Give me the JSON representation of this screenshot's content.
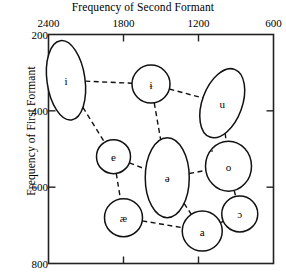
{
  "chart_data": {
    "type": "scatter",
    "title": "",
    "xlabel": "Frequency of Second Formant",
    "ylabel": "Frequency of First Formant",
    "xticks": [
      2400,
      1800,
      1200,
      600
    ],
    "yticks": [
      200,
      400,
      600,
      800
    ],
    "xlim": [
      2400,
      600
    ],
    "ylim": [
      200,
      800
    ],
    "x_axis_position": "top",
    "y_axis_direction": "inverted",
    "grid": false,
    "legend": null,
    "note": "Vowel formant chart: each labelled ellipse marks the dispersion region of one vowel; dashed lines connect neighbouring vowels.",
    "points": [
      {
        "label": "i",
        "f2": 2260,
        "f1": 320,
        "shape": "ellipse",
        "rx": 19,
        "ry": 40,
        "rotate": -8
      },
      {
        "label": "ɨ",
        "f2": 1580,
        "f1": 330,
        "shape": "circle",
        "rx": 19,
        "ry": 19,
        "rotate": 0
      },
      {
        "label": "u",
        "f2": 1010,
        "f1": 380,
        "shape": "ellipse",
        "rx": 20,
        "ry": 36,
        "rotate": 20
      },
      {
        "label": "e",
        "f2": 1880,
        "f1": 520,
        "shape": "circle",
        "rx": 17,
        "ry": 17,
        "rotate": 0
      },
      {
        "label": "ə",
        "f2": 1450,
        "f1": 575,
        "shape": "ellipse",
        "rx": 22,
        "ry": 40,
        "rotate": 0
      },
      {
        "label": "o",
        "f2": 960,
        "f1": 545,
        "shape": "ellipse",
        "rx": 23,
        "ry": 25,
        "rotate": 0
      },
      {
        "label": "æ",
        "f2": 1800,
        "f1": 680,
        "shape": "circle",
        "rx": 19,
        "ry": 19,
        "rotate": 0
      },
      {
        "label": "a",
        "f2": 1170,
        "f1": 715,
        "shape": "circle",
        "rx": 20,
        "ry": 20,
        "rotate": 0
      },
      {
        "label": "ɔ",
        "f2": 870,
        "f1": 670,
        "shape": "circle",
        "rx": 18,
        "ry": 18,
        "rotate": 0
      }
    ],
    "links": [
      [
        "i",
        "ɨ"
      ],
      [
        "ɨ",
        "u"
      ],
      [
        "i",
        "e"
      ],
      [
        "ɨ",
        "ə"
      ],
      [
        "u",
        "o"
      ],
      [
        "e",
        "ə"
      ],
      [
        "ə",
        "o"
      ],
      [
        "e",
        "æ"
      ],
      [
        "ə",
        "a"
      ],
      [
        "æ",
        "a"
      ],
      [
        "a",
        "ɔ"
      ],
      [
        "o",
        "ɔ"
      ]
    ]
  }
}
